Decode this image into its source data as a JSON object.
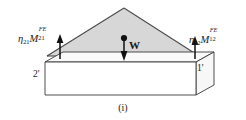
{
  "figure": {
    "caption": "(i)",
    "type": "structural-load-diagram"
  },
  "labels": {
    "left_moment": {
      "eta": "η",
      "eta_sub": "21",
      "moment_symbol": "M",
      "moment_sup": "FE",
      "moment_sub": "21"
    },
    "right_moment": {
      "eta": "η",
      "eta_sub": "12",
      "moment_symbol": "M",
      "moment_sup": "FE",
      "moment_sub": "12"
    },
    "weight": "W",
    "dimension_left": "2'",
    "dimension_right": "1'"
  },
  "colors": {
    "load_fill": "#d7d7d7",
    "outline": "#3a3a3a",
    "slab_fill": "#ffffff",
    "slab_top_fill": "#fdfdfd",
    "text": "#1a1a1a",
    "arrow": "#111111",
    "background": "#ffffff"
  },
  "geometry": {
    "load_triangle": {
      "apex": [
        124,
        8
      ],
      "base_left": [
        47,
        56
      ],
      "base_right": [
        199,
        56
      ]
    },
    "slab": {
      "top_front_left": [
        45,
        62
      ],
      "top_front_right": [
        196,
        62
      ],
      "bottom_front_left": [
        45,
        95
      ],
      "bottom_front_right": [
        196,
        95
      ],
      "depth_offset": [
        18,
        -10
      ]
    },
    "arrows": {
      "left_reaction": {
        "x": 60,
        "y_base": 58,
        "y_tip": 36,
        "direction": "up"
      },
      "right_reaction": {
        "x": 195,
        "y_base": 58,
        "y_tip": 37,
        "direction": "up"
      },
      "weight": {
        "x": 124,
        "y_base": 37,
        "y_tip": 60,
        "direction": "down"
      }
    }
  }
}
